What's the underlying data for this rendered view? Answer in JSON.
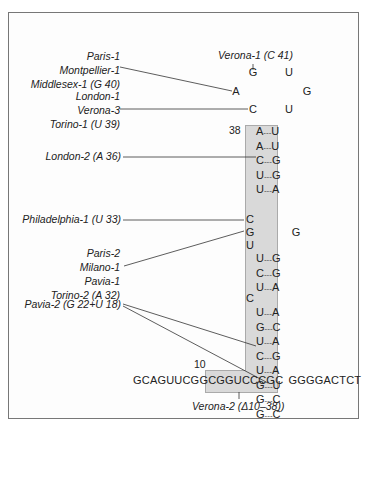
{
  "figure": {
    "annotations": {
      "verona1": "Verona-1 (C 41)",
      "group1": [
        "Paris-1",
        "Montpellier-1",
        "Middlesex-1 (G 40)"
      ],
      "group2": [
        "London-1",
        "Verona-3",
        "Torino-1 (U 39)"
      ],
      "london2": "London-2 (A 36)",
      "philadelphia1": "Philadelphia-1 (U 33)",
      "group3": [
        "Paris-2",
        "Milano-1",
        "Pavia-1",
        "Torino-2 (A 32)"
      ],
      "pavia2": "Pavia-2 (G 22+U 18)",
      "verona2": "Verona-2 (Δ10–38))"
    },
    "position_labels": {
      "p38": "38",
      "p10": "10"
    },
    "loop": {
      "top_left": "G",
      "top_right": "U",
      "mid_left": "A",
      "mid_right": "G",
      "low_left": "C",
      "low_right": "U"
    },
    "stem_upper": [
      {
        "left": "A",
        "right": "U"
      },
      {
        "left": "A",
        "right": "U"
      },
      {
        "left": "C",
        "right": "G"
      },
      {
        "left": "U",
        "right": "G"
      },
      {
        "left": "U",
        "right": "A"
      }
    ],
    "bulge": {
      "c1": "C",
      "g1": "G",
      "u1": "U",
      "right_g": "G"
    },
    "stem_middle": [
      {
        "left": "U",
        "right": "G"
      },
      {
        "left": "C",
        "right": "G"
      },
      {
        "left": "U",
        "right": "A"
      }
    ],
    "bulge2": "C",
    "stem_lower": [
      {
        "left": "U",
        "right": "A"
      },
      {
        "left": "G",
        "right": "C"
      },
      {
        "left": "U",
        "right": "A"
      },
      {
        "left": "C",
        "right": "G"
      },
      {
        "left": "U",
        "right": "A"
      },
      {
        "left": "G",
        "right": "U"
      },
      {
        "left": "G",
        "right": "C"
      },
      {
        "left": "G",
        "right": "C"
      }
    ],
    "sequence": {
      "left_part": "GCAGUUCGG",
      "boxed_part": "CGGUCCCGC",
      "right_part": "GGGGACTCT"
    },
    "pair_dash": "---"
  }
}
